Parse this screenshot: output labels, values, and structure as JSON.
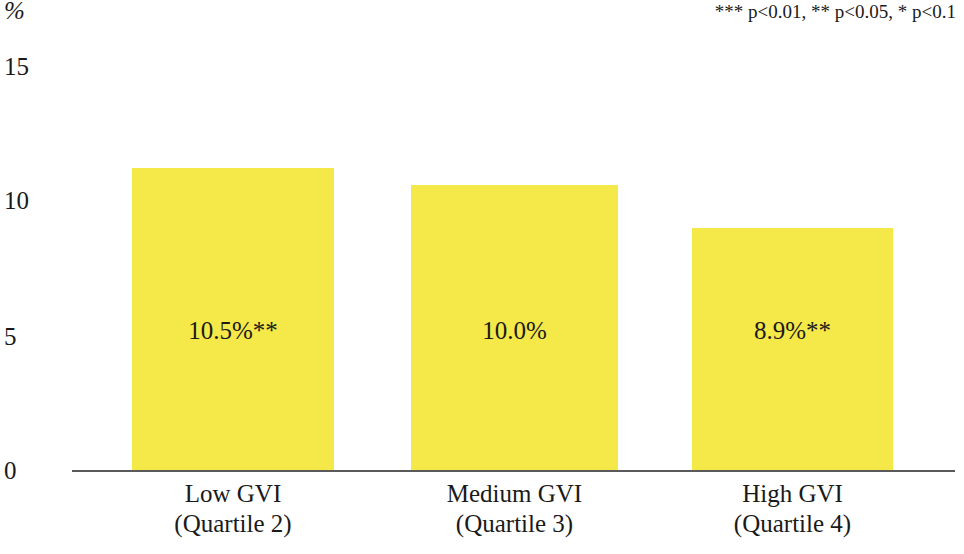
{
  "axis": {
    "unit_label": "%",
    "y_ticks": [
      "15",
      "10",
      "5",
      "0"
    ]
  },
  "annotations": {
    "significance_note": "*** p<0.01, ** p<0.05, * p<0.1"
  },
  "colors": {
    "bar_fill": "#F5E849",
    "axis_line": "#5a5a5a",
    "text": "#1a1a1a"
  },
  "chart_data": {
    "type": "bar",
    "title": "",
    "xlabel": "",
    "ylabel": "%",
    "ylim": [
      0,
      15
    ],
    "yticks": [
      0,
      5,
      10,
      15
    ],
    "grid": false,
    "legend": "none",
    "categories": [
      {
        "line1": "Low GVI",
        "line2": "(Quartile 2)"
      },
      {
        "line1": "Medium GVI",
        "line2": "(Quartile 3)"
      },
      {
        "line1": "High GVI",
        "line2": "(Quartile 4)"
      }
    ],
    "values": [
      10.5,
      10.0,
      8.9
    ],
    "data_labels": [
      "10.5%**",
      "10.0%",
      "8.9%**"
    ],
    "significance": [
      "**",
      "",
      "**"
    ],
    "annotations": [
      "*** p<0.01, ** p<0.05, * p<0.1"
    ]
  }
}
